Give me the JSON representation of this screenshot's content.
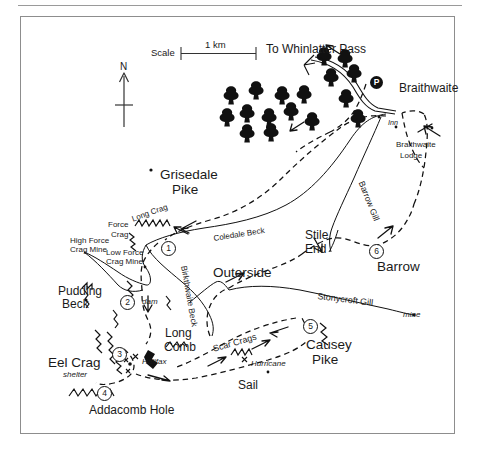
{
  "figure": {
    "frame": {
      "border_color": "#8d8d8d",
      "background": "#ffffff"
    },
    "rule_color": "#9a9a9a"
  },
  "scale_bar": {
    "label": "Scale",
    "distance": "1 km"
  },
  "compass": {
    "north_label": "N"
  },
  "destinations": [
    {
      "name": "to-whinlatter-pass",
      "label": "To Whinlatter Pass",
      "x": 266,
      "y": 43
    }
  ],
  "settlements": [
    {
      "name": "braithwaite",
      "label": "Braithwaite",
      "x": 399,
      "y": 82,
      "size": "place"
    },
    {
      "name": "inn",
      "label": "Inn",
      "x": 388,
      "y": 119,
      "size": "tiny",
      "italic": true
    },
    {
      "name": "braithwaite-lodge",
      "label": "Braithwaite",
      "x": 396,
      "y": 141,
      "size": "small"
    },
    {
      "name": "braithwaite-lodge-2",
      "label": "Lodge",
      "x": 400,
      "y": 152,
      "size": "small"
    }
  ],
  "peaks": [
    {
      "name": "grisedale-pike",
      "label": "Grisedale",
      "x": 160,
      "y": 168
    },
    {
      "name": "grisedale-pike-2",
      "label": "Pike",
      "x": 172,
      "y": 183
    },
    {
      "name": "eel-crag",
      "label": "Eel Crag",
      "x": 48,
      "y": 356
    },
    {
      "name": "causey-pike",
      "label": "Causey",
      "x": 306,
      "y": 338
    },
    {
      "name": "causey-pike-2",
      "label": "Pike",
      "x": 312,
      "y": 353
    },
    {
      "name": "barrow",
      "label": "Barrow",
      "x": 377,
      "y": 260
    },
    {
      "name": "outerside",
      "label": "Outerside",
      "x": 213,
      "y": 266
    },
    {
      "name": "sail",
      "label": "Sail",
      "x": 238,
      "y": 379
    }
  ],
  "features": [
    {
      "name": "long-crag",
      "label": "Long Crag",
      "x": 131,
      "y": 216,
      "class": "lbl-small lbl-rot-longcrag"
    },
    {
      "name": "force-crag",
      "label": "Force",
      "x": 108,
      "y": 221,
      "class": "lbl-small"
    },
    {
      "name": "force-crag-2",
      "label": "Crag",
      "x": 111,
      "y": 231,
      "class": "lbl-small"
    },
    {
      "name": "high-force-crag-mine",
      "label": "High Force",
      "x": 70,
      "y": 237,
      "class": "lbl-small"
    },
    {
      "name": "high-force-crag-mine-2",
      "label": "Crag Mine",
      "x": 70,
      "y": 246,
      "class": "lbl-small"
    },
    {
      "name": "low-force-crag-mine",
      "label": "Low Force",
      "x": 106,
      "y": 249,
      "class": "lbl-small"
    },
    {
      "name": "low-force-crag-mine-2",
      "label": "Crag Mine",
      "x": 106,
      "y": 258,
      "class": "lbl-small"
    },
    {
      "name": "pudding-beck",
      "label": "Pudding",
      "x": 58,
      "y": 285,
      "class": "lbl-place"
    },
    {
      "name": "pudding-beck-2",
      "label": "Beck",
      "x": 62,
      "y": 298,
      "class": "lbl-place"
    },
    {
      "name": "coledale-beck",
      "label": "Coledale Beck",
      "x": 213,
      "y": 235,
      "class": "lbl-small lbl-rot-coledale"
    },
    {
      "name": "birkthwaite-beck",
      "label": "Birkthwaite Beck",
      "x": 188,
      "y": 265,
      "class": "lbl-rot-birk"
    },
    {
      "name": "barrow-gill",
      "label": "Barrow Gill",
      "x": 365,
      "y": 180,
      "class": "lbl-rot-barrowgill"
    },
    {
      "name": "stonycroft-gill",
      "label": "Stonycroft Gill",
      "x": 318,
      "y": 292,
      "class": "lbl-rot-stony"
    },
    {
      "name": "scar-crags",
      "label": "Scar Crags",
      "x": 212,
      "y": 345,
      "class": "lbl-small lbl-rot-scar"
    },
    {
      "name": "long-comb",
      "label": "Long",
      "x": 165,
      "y": 327,
      "class": "lbl-place"
    },
    {
      "name": "long-comb-2",
      "label": "Comb",
      "x": 164,
      "y": 341,
      "class": "lbl-place"
    },
    {
      "name": "stile-end",
      "label": "Stile",
      "x": 305,
      "y": 229,
      "class": "lbl-place"
    },
    {
      "name": "stile-end-2",
      "label": "End",
      "x": 305,
      "y": 243,
      "class": "lbl-place"
    },
    {
      "name": "addacomb-hole",
      "label": "Addacomb Hole",
      "x": 89,
      "y": 404,
      "class": "lbl-place"
    },
    {
      "name": "dam",
      "label": "dam",
      "x": 142,
      "y": 298,
      "class": "lbl-small lbl-ital"
    },
    {
      "name": "shelter",
      "label": "shelter",
      "x": 63,
      "y": 371,
      "class": "lbl-small lbl-ital"
    },
    {
      "name": "halifax-wreck",
      "label": "Halifax",
      "x": 142,
      "y": 358,
      "class": "lbl-small lbl-ital"
    },
    {
      "name": "hurricane-wreck",
      "label": "Hurricane",
      "x": 251,
      "y": 360,
      "class": "lbl-small lbl-ital"
    },
    {
      "name": "mine",
      "label": "mine",
      "x": 403,
      "y": 311,
      "class": "lbl-small lbl-ital"
    }
  ],
  "route_markers": [
    {
      "name": "route-marker-1",
      "label": "1",
      "x": 161,
      "y": 241
    },
    {
      "name": "route-marker-2",
      "label": "2",
      "x": 120,
      "y": 295
    },
    {
      "name": "route-marker-3",
      "label": "3",
      "x": 112,
      "y": 347
    },
    {
      "name": "route-marker-4",
      "label": "4",
      "x": 97,
      "y": 386
    },
    {
      "name": "route-marker-5",
      "label": "5",
      "x": 303,
      "y": 319
    },
    {
      "name": "route-marker-6",
      "label": "6",
      "x": 369,
      "y": 244
    },
    {
      "name": "parking-marker",
      "label": "P",
      "x": 370,
      "y": 76,
      "type": "parking"
    }
  ],
  "wreck_sites": [
    {
      "name": "halifax-x-marker",
      "x": 136,
      "y": 357
    },
    {
      "name": "hurricane-x-marker",
      "x": 245,
      "y": 360
    }
  ],
  "colors": {
    "ink": "#111111",
    "frame": "#8d8d8d",
    "paper": "#ffffff"
  }
}
